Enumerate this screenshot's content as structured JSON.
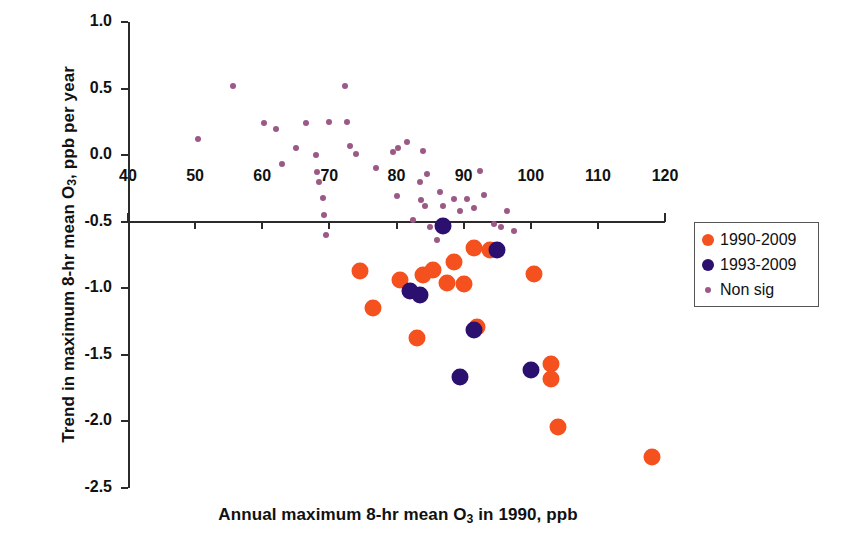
{
  "chart_data": {
    "type": "scatter",
    "title": "",
    "xlabel": "Annual maximum 8-hr mean O3 in 1990, ppb",
    "ylabel": "Trend in maximum 8-hr mean O3, ppb per year",
    "xlim": [
      40,
      120
    ],
    "ylim": [
      -2.5,
      1.0
    ],
    "xticks": [
      40,
      50,
      60,
      70,
      80,
      90,
      100,
      110,
      120
    ],
    "yticks": [
      1.0,
      0.5,
      0.0,
      -0.5,
      -1.0,
      -1.5,
      -2.0,
      -2.5
    ],
    "xtick_labels": [
      "40",
      "50",
      "60",
      "70",
      "80",
      "90",
      "100",
      "110",
      "120"
    ],
    "ytick_labels": [
      "1.0",
      "0.5",
      "0.0",
      "-0.5",
      "-1.0",
      "-1.5",
      "-2.0",
      "-2.5"
    ],
    "grid": false,
    "legend_position": "right",
    "series": [
      {
        "name": "1990-2009",
        "color": "#f4511e",
        "marker": "circle",
        "marker_size": 17,
        "points": [
          [
            74.5,
            -0.87
          ],
          [
            76.5,
            -1.15
          ],
          [
            80.5,
            -0.94
          ],
          [
            84.0,
            -0.9
          ],
          [
            83.0,
            -1.37
          ],
          [
            85.5,
            -0.86
          ],
          [
            87.5,
            -0.96
          ],
          [
            88.5,
            -0.8
          ],
          [
            90.0,
            -0.97
          ],
          [
            91.5,
            -0.7
          ],
          [
            92.0,
            -1.29
          ],
          [
            94.0,
            -0.71
          ],
          [
            100.5,
            -0.89
          ],
          [
            103.0,
            -1.57
          ],
          [
            103.0,
            -1.68
          ],
          [
            104.0,
            -2.04
          ],
          [
            118.0,
            -2.27
          ]
        ]
      },
      {
        "name": "1993-2009",
        "color": "#2b1070",
        "marker": "circle",
        "marker_size": 17,
        "points": [
          [
            82.0,
            -1.02
          ],
          [
            83.5,
            -1.05
          ],
          [
            87.0,
            -0.53
          ],
          [
            91.5,
            -1.31
          ],
          [
            95.0,
            -0.71
          ],
          [
            89.5,
            -1.67
          ],
          [
            100.0,
            -1.61
          ]
        ]
      },
      {
        "name": "Non sig",
        "color": "#9b5a86",
        "marker": "dot",
        "marker_size": 6,
        "points": [
          [
            50.5,
            0.12
          ],
          [
            55.7,
            0.52
          ],
          [
            60.2,
            0.24
          ],
          [
            62.0,
            0.2
          ],
          [
            63.0,
            -0.07
          ],
          [
            65.0,
            0.05
          ],
          [
            66.5,
            0.24
          ],
          [
            68.0,
            0.0
          ],
          [
            68.2,
            -0.13
          ],
          [
            68.4,
            -0.2
          ],
          [
            69.0,
            -0.32
          ],
          [
            69.2,
            -0.45
          ],
          [
            69.5,
            -0.6
          ],
          [
            70.0,
            0.25
          ],
          [
            72.3,
            0.52
          ],
          [
            73.0,
            0.07
          ],
          [
            72.6,
            0.25
          ],
          [
            74.0,
            0.01
          ],
          [
            77.0,
            -0.1
          ],
          [
            79.5,
            0.02
          ],
          [
            80.2,
            0.05
          ],
          [
            80.0,
            -0.31
          ],
          [
            81.5,
            0.1
          ],
          [
            82.5,
            -0.49
          ],
          [
            83.5,
            -0.2
          ],
          [
            83.6,
            -0.34
          ],
          [
            84.0,
            0.03
          ],
          [
            84.5,
            -0.14
          ],
          [
            84.2,
            -0.38
          ],
          [
            85.0,
            -0.54
          ],
          [
            86.0,
            -0.64
          ],
          [
            86.5,
            -0.28
          ],
          [
            87.0,
            -0.38
          ],
          [
            88.5,
            -0.33
          ],
          [
            89.5,
            -0.42
          ],
          [
            90.5,
            -0.33
          ],
          [
            91.5,
            -0.4
          ],
          [
            92.5,
            -0.12
          ],
          [
            93.0,
            -0.3
          ],
          [
            94.5,
            -0.52
          ],
          [
            95.5,
            -0.54
          ],
          [
            96.5,
            -0.42
          ],
          [
            97.5,
            -0.57
          ],
          [
            101.0,
            -0.88
          ]
        ]
      }
    ]
  },
  "legend": {
    "items": [
      {
        "label": "1990-2009",
        "marker": "sig90"
      },
      {
        "label": "1993-2009",
        "marker": "sig93"
      },
      {
        "label": "Non sig",
        "marker": "nonsig"
      }
    ]
  },
  "axis_titles": {
    "x_prefix": "Annual maximum 8-hr mean O",
    "x_sub": "3",
    "x_suffix": " in 1990, ppb",
    "y_prefix": "Trend in maximum 8-hr mean O",
    "y_sub": "3",
    "y_suffix": ", ppb per year"
  },
  "colors": {
    "sig90": "#f4511e",
    "sig93": "#2b1070",
    "nonsig": "#9b5a86",
    "axis": "#2b2b2b",
    "text": "#111111",
    "background": "#ffffff"
  }
}
